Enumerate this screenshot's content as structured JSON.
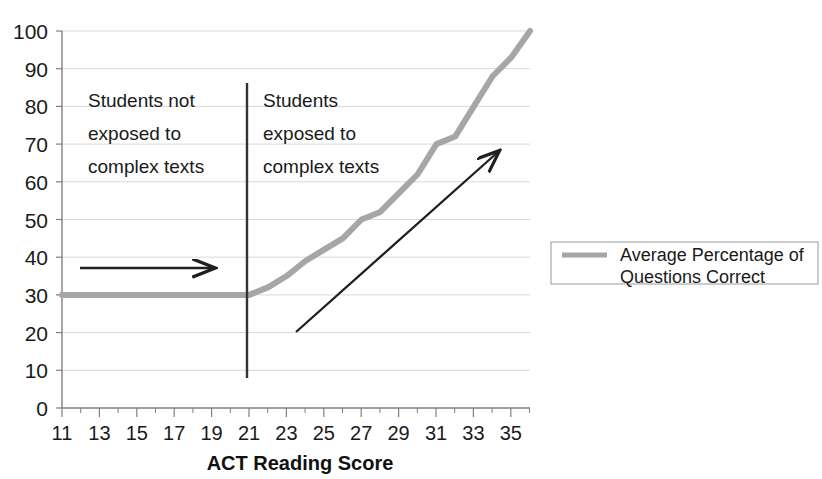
{
  "chart_data": {
    "type": "line",
    "title": "",
    "xlabel": "ACT Reading Score",
    "ylabel": "",
    "xlim": [
      11,
      36
    ],
    "ylim": [
      0,
      100
    ],
    "grid": true,
    "legend_position": "right",
    "x_ticks": [
      11,
      13,
      15,
      17,
      19,
      21,
      23,
      25,
      27,
      29,
      31,
      33,
      35
    ],
    "x_tick_labels": [
      "11",
      "13",
      "15",
      "17",
      "19",
      "21",
      "23",
      "25",
      "27",
      "29",
      "31",
      "33",
      "35"
    ],
    "x_minor_ticks": [
      12,
      14,
      16,
      18,
      20,
      22,
      24,
      26,
      28,
      30,
      32,
      34,
      36
    ],
    "y_ticks": [
      0,
      10,
      20,
      30,
      40,
      50,
      60,
      70,
      80,
      90,
      100
    ],
    "y_tick_labels": [
      "0",
      "10",
      "20",
      "30",
      "40",
      "50",
      "60",
      "70",
      "80",
      "90",
      "100"
    ],
    "series": [
      {
        "name": "Average Percentage of Questions Correct",
        "color": "#a6a6a6",
        "x": [
          11,
          12,
          13,
          14,
          15,
          16,
          17,
          18,
          19,
          20,
          21,
          22,
          23,
          24,
          25,
          26,
          27,
          28,
          29,
          30,
          31,
          32,
          33,
          34,
          35,
          36
        ],
        "values": [
          30,
          30,
          30,
          30,
          30,
          30,
          30,
          30,
          30,
          30,
          30,
          32,
          35,
          39,
          42,
          45,
          50,
          52,
          57,
          62,
          70,
          72,
          80,
          88,
          93,
          100
        ]
      }
    ],
    "annotations": [
      {
        "name": "left-region-label",
        "text_lines": [
          "Students not",
          "exposed to",
          "complex texts"
        ],
        "x": 12.2,
        "y": 80
      },
      {
        "name": "right-region-label",
        "text_lines": [
          "Students",
          "exposed to",
          "complex texts"
        ],
        "x": 21.6,
        "y": 80
      },
      {
        "name": "divider-line",
        "type": "vline",
        "x": 21,
        "y_from": 8,
        "y_to": 86
      },
      {
        "name": "horizontal-arrow",
        "type": "arrow",
        "x_from": 11.9,
        "y_from": 36,
        "x_to": 19.6,
        "y_to": 36
      },
      {
        "name": "diagonal-arrow",
        "type": "arrow",
        "x_from": 23.4,
        "y_from": 20,
        "x_to": 34.3,
        "y_to": 67
      }
    ]
  },
  "legend": {
    "entries": [
      {
        "label_line1": "Average Percentage of",
        "label_line2": "Questions Correct",
        "color": "#a6a6a6"
      }
    ]
  },
  "axis": {
    "x_title": "ACT Reading Score"
  },
  "colors": {
    "series_gray": "#a6a6a6",
    "grid": "#d9d9d9",
    "axis": "#808080",
    "annotation": "#262626",
    "text": "#1a1a1a"
  }
}
